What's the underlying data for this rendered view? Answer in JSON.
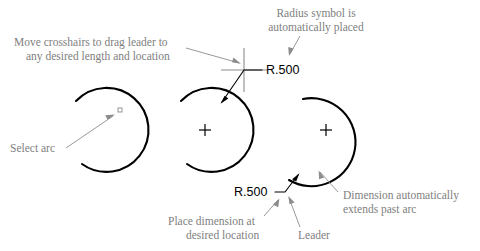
{
  "figure": {
    "background_color": "#ffffff",
    "annotation_color": "#808080",
    "geometry_color": "#000000"
  },
  "annotations": {
    "move_crosshairs_line1": "Move crosshairs to drag leader to",
    "move_crosshairs_line2": "any desired length and location",
    "radius_symbol_line1": "Radius symbol is",
    "radius_symbol_line2": "automatically placed",
    "select_arc": "Select arc",
    "place_dimension_line1": "Place dimension at",
    "place_dimension_line2": "desired location",
    "leader": "Leader",
    "dimension_extends_line1": "Dimension automatically",
    "dimension_extends_line2": "extends past arc"
  },
  "dimensions": {
    "radius_top": "R.500",
    "radius_bottom": "R.500"
  },
  "steps": [
    {
      "index": 1,
      "name": "select-arc-step",
      "label": "Select arc",
      "arc_center": [
        100,
        130
      ],
      "arc_radius": 42,
      "has_center_mark": false,
      "has_leader": false,
      "has_dimension": false
    },
    {
      "index": 2,
      "name": "drag-leader-step",
      "label": "Move crosshairs to drag leader to any desired length and location",
      "arc_center": [
        205,
        130
      ],
      "arc_radius": 42,
      "has_center_mark": true,
      "has_leader": true,
      "has_dimension": true,
      "dimension_value": "R.500",
      "crosshair_point": [
        244,
        70
      ]
    },
    {
      "index": 3,
      "name": "place-dimension-step",
      "label": "Place dimension at desired location",
      "arc_center": [
        326,
        130
      ],
      "arc_radius": 44,
      "has_center_mark": true,
      "has_leader": true,
      "has_dimension": true,
      "dimension_value": "R.500"
    }
  ]
}
